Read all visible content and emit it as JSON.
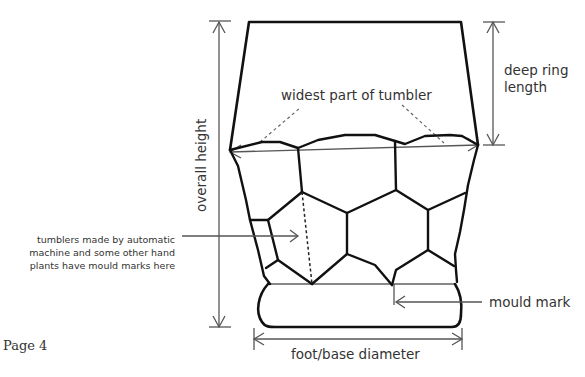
{
  "page": {
    "label": "Page 4"
  },
  "labels": {
    "widest_part": "widest part of tumbler",
    "deep_ring_length_line1": "deep ring",
    "deep_ring_length_line2": "length",
    "overall_height": "overall height",
    "mould_note_line1": "tumblers made by automatic",
    "mould_note_line2": "machine and some other hand",
    "mould_note_line3": "plants have mould marks here",
    "mould_mark": "mould mark",
    "foot_base_diameter": "foot/base diameter"
  },
  "colors": {
    "ink": "#111111",
    "dimension_line": "#555555",
    "text": "#333333",
    "background": "#ffffff"
  }
}
